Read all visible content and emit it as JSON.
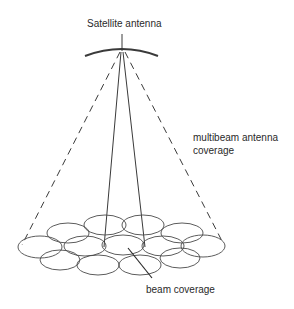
{
  "diagram": {
    "type": "satellite multibeam antenna coverage illustration",
    "labels": {
      "satellite_antenna": "Satellite antenna",
      "multibeam_line1": "multibeam antenna",
      "multibeam_line2": "coverage",
      "beam_coverage": "beam coverage"
    },
    "colors": {
      "stroke": "#3a3a3a",
      "text": "#2a2a2a",
      "background": "#ffffff"
    },
    "elements": {
      "antenna": {
        "apex": [
          122,
          50
        ],
        "arc_span": [
          85,
          158
        ]
      },
      "coverage_cone": {
        "style": "dashed",
        "left_end": [
          22,
          245
        ],
        "right_end": [
          223,
          243
        ]
      },
      "single_beam": {
        "style": "solid",
        "left_end": [
          104,
          247
        ],
        "right_end": [
          145,
          247
        ]
      },
      "beam_cells": 12
    }
  }
}
